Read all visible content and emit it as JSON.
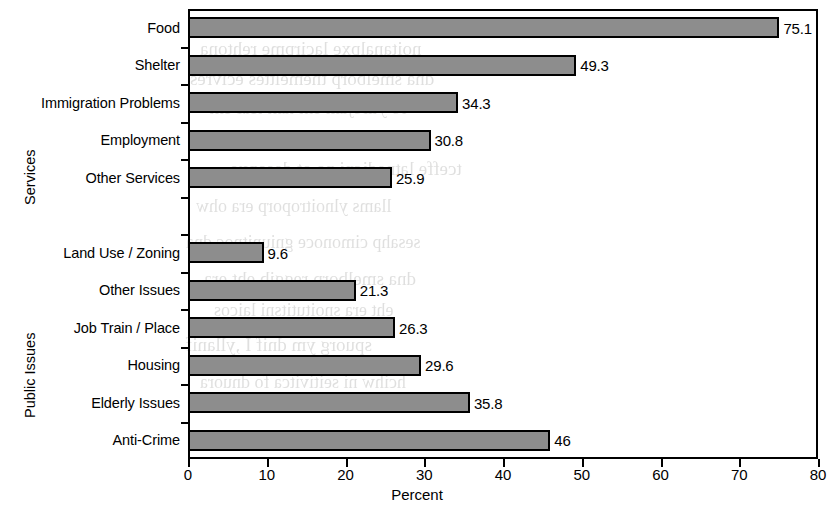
{
  "chart_data": {
    "type": "bar",
    "orientation": "horizontal",
    "title": "",
    "xlabel": "Percent",
    "ylabel": "",
    "xlim": [
      0,
      80
    ],
    "xticks": [
      "0",
      "10",
      "20",
      "30",
      "40",
      "50",
      "60",
      "70",
      "80"
    ],
    "grid": false,
    "legend": null,
    "value_labels": true,
    "groups": [
      {
        "name": "Services",
        "categories": [
          "Food",
          "Shelter",
          "Immigration Problems",
          "Employment",
          "Other Services"
        ],
        "values": [
          75.1,
          49.3,
          34.3,
          30.8,
          25.9
        ],
        "value_labels": [
          "75.1",
          "49.3",
          "34.3",
          "30.8",
          "25.9"
        ]
      },
      {
        "name": "Public Issues",
        "categories": [
          "Land Use / Zoning",
          "Other Issues",
          "Job Train / Place",
          "Housing",
          "Elderly Issues",
          "Anti-Crime"
        ],
        "values": [
          9.6,
          21.3,
          26.3,
          29.6,
          35.8,
          46
        ],
        "value_labels": [
          "9.6",
          "21.3",
          "26.3",
          "29.6",
          "35.8",
          "46"
        ]
      }
    ],
    "categories": [
      "Food",
      "Shelter",
      "Immigration Problems",
      "Employment",
      "Other Services",
      "Land Use / Zoning",
      "Other Issues",
      "Job Train / Place",
      "Housing",
      "Elderly Issues",
      "Anti-Crime"
    ],
    "values": [
      75.1,
      49.3,
      34.3,
      30.8,
      25.9,
      9.6,
      21.3,
      26.3,
      29.6,
      35.8,
      46
    ],
    "colors": {
      "bar_fill": "#8d8d8d",
      "bar_stroke": "#000000",
      "axis": "#000000",
      "background": "#ffffff"
    }
  },
  "axis": {
    "x_title": "Percent",
    "ticks": [
      {
        "label": "0",
        "value": 0
      },
      {
        "label": "10",
        "value": 10
      },
      {
        "label": "20",
        "value": 20
      },
      {
        "label": "30",
        "value": 30
      },
      {
        "label": "40",
        "value": 40
      },
      {
        "label": "50",
        "value": 50
      },
      {
        "label": "60",
        "value": 60
      },
      {
        "label": "70",
        "value": 70
      },
      {
        "label": "80",
        "value": 80
      }
    ]
  },
  "group_titles": {
    "services": "Services",
    "public_issues": "Public Issues"
  },
  "bleed_through": {
    "lines": [
      "noitanalpxe lacirpme rehtona",
      "dna smelborp tnemelttes ecivres",
      "ro ytirojam eht taht tcaf eht",
      "sretsulc ylevitaler esuaceb",
      "tceffe latnedicni na ot desopxe",
      "llams ylnoitroporp era ohw",
      "sesahp cimonoce gniunitnoc dna",
      "dna smelborp reggib eht era",
      "eht era snoitutitsni laicos",
      "spuorg ym dnif I ,yllanif",
      "hcihw ni seitivitca fo dnuora"
    ]
  }
}
